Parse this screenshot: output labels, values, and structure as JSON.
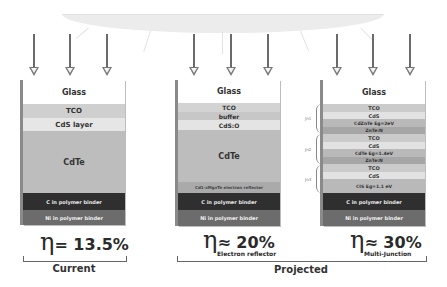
{
  "illustration": {
    "sun_band": "light-source-band",
    "arrow_color": "#6a6a6a"
  },
  "stacks": [
    {
      "id": "current",
      "layers": [
        {
          "label": "Glass",
          "bg": "#ffffff",
          "color": "#333333",
          "size": 8
        },
        {
          "label": "TCO",
          "bg": "#cfcfcf",
          "color": "#333333",
          "size": 7
        },
        {
          "label": "CdS layer",
          "bg": "#e6e6e6",
          "color": "#333333",
          "size": 7
        },
        {
          "label": "CdTe",
          "bg": "#bdbdbd",
          "color": "#333333",
          "size": 8
        },
        {
          "label": "C in polymer binder",
          "bg": "#2f2f2f",
          "color": "#e8e8e8",
          "size": 5
        },
        {
          "label": "Ni in polymer binder",
          "bg": "#6c6c6c",
          "color": "#efefef",
          "size": 5
        }
      ]
    },
    {
      "id": "electron-reflector",
      "layers": [
        {
          "label": "Glass",
          "bg": "#ffffff",
          "color": "#333333",
          "size": 8
        },
        {
          "label": "TCO",
          "bg": "#d3d3d3",
          "color": "#333333",
          "size": 6
        },
        {
          "label": "buffer",
          "bg": "#c7c7c7",
          "color": "#333333",
          "size": 6
        },
        {
          "label": "CdS:O",
          "bg": "#e4e4e4",
          "color": "#333333",
          "size": 6
        },
        {
          "label": "CdTe",
          "bg": "#bdbdbd",
          "color": "#333333",
          "size": 8
        },
        {
          "label": "Cd1-xMgxTe  electron reflector",
          "bg": "#aaaaaa",
          "color": "#444444",
          "size": 4
        },
        {
          "label": "C in polymer binder",
          "bg": "#2f2f2f",
          "color": "#e8e8e8",
          "size": 5
        },
        {
          "label": "Ni in polymer binder",
          "bg": "#6c6c6c",
          "color": "#efefef",
          "size": 5
        }
      ]
    },
    {
      "id": "multi-junction",
      "layers": [
        {
          "label": "Glass",
          "bg": "#ffffff",
          "color": "#333333",
          "size": 8
        },
        {
          "label": "TCO",
          "bg": "#cbcbcb",
          "color": "#333333",
          "size": 5
        },
        {
          "label": "CdS",
          "bg": "#e2e2e2",
          "color": "#333333",
          "size": 5
        },
        {
          "label": "CdZnTe Eg=2eV",
          "bg": "#b9b9b9",
          "color": "#333333",
          "size": 4.5
        },
        {
          "label": "ZnTe:N",
          "bg": "#a6a6a6",
          "color": "#333333",
          "size": 4.5
        },
        {
          "label": "TCO",
          "bg": "#cbcbcb",
          "color": "#333333",
          "size": 5
        },
        {
          "label": "CdS",
          "bg": "#e2e2e2",
          "color": "#333333",
          "size": 5
        },
        {
          "label": "CdTe Eg=1.4eV",
          "bg": "#b9b9b9",
          "color": "#333333",
          "size": 4.5
        },
        {
          "label": "ZnTe:N",
          "bg": "#a6a6a6",
          "color": "#333333",
          "size": 4.5
        },
        {
          "label": "TCO",
          "bg": "#cbcbcb",
          "color": "#333333",
          "size": 5
        },
        {
          "label": "CdS",
          "bg": "#e2e2e2",
          "color": "#333333",
          "size": 5
        },
        {
          "label": "CIS Eg=1.1 eV",
          "bg": "#b9b9b9",
          "color": "#333333",
          "size": 4.5
        },
        {
          "label": "C in polymer binder",
          "bg": "#2f2f2f",
          "color": "#e8e8e8",
          "size": 5
        },
        {
          "label": "Ni in polymer binder",
          "bg": "#6c6c6c",
          "color": "#efefef",
          "size": 5
        }
      ],
      "junction_labels": [
        "Jn1",
        "Jn2",
        "Jn3"
      ]
    }
  ],
  "efficiency": {
    "current": {
      "symbol": "η",
      "relation": "= 13.5%",
      "subscript": ""
    },
    "electron_reflector": {
      "symbol": "η",
      "relation": "≈ 20%",
      "subscript": "Electron reflector"
    },
    "multi_junction": {
      "symbol": "η",
      "relation": "≈ 30%",
      "subscript": "Multi-Junction"
    }
  },
  "groups": {
    "current": "Current",
    "projected": "Projected"
  }
}
